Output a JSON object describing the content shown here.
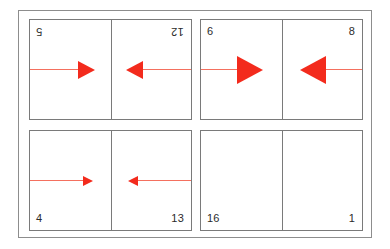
{
  "figure": {
    "type": "grid-diagram",
    "background_color": "#ffffff",
    "frame_color": "#8d8d8d",
    "panel_border_color": "#7a7a7a",
    "arrow_head_color": "#f32b1d",
    "arrow_shaft_color": "#f4705f",
    "label_color": "#2b2b2b",
    "grid_rows": 2,
    "grid_columns": 2
  },
  "quadrants": [
    {
      "name": "top-left",
      "arrow_size": "medium",
      "label_orientation": "rotated-180",
      "label_anchor": "top",
      "cells": [
        {
          "label": "5",
          "arrow": "right",
          "arrow_size": "medium"
        },
        {
          "label": "12",
          "arrow": "left",
          "arrow_size": "medium"
        }
      ]
    },
    {
      "name": "top-right",
      "arrow_size": "large",
      "label_orientation": "upright",
      "label_anchor": "top",
      "cells": [
        {
          "label": "6",
          "arrow": "right",
          "arrow_size": "large"
        },
        {
          "label": "8",
          "arrow": "left",
          "arrow_size": "large"
        }
      ]
    },
    {
      "name": "bottom-left",
      "arrow_size": "small",
      "label_orientation": "upright",
      "label_anchor": "bottom",
      "cells": [
        {
          "label": "4",
          "arrow": "right",
          "arrow_size": "small"
        },
        {
          "label": "13",
          "arrow": "left",
          "arrow_size": "small"
        }
      ]
    },
    {
      "name": "bottom-right",
      "arrow_size": "none",
      "label_orientation": "upright",
      "label_anchor": "bottom",
      "cells": [
        {
          "label": "16",
          "arrow": "none",
          "arrow_size": "none"
        },
        {
          "label": "1",
          "arrow": "none",
          "arrow_size": "none"
        }
      ]
    }
  ]
}
